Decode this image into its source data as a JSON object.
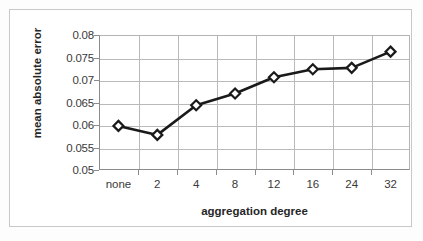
{
  "chart_data": {
    "type": "line",
    "title": "",
    "xlabel": "aggregation degree",
    "ylabel": "mean absolute error",
    "categories": [
      "none",
      "2",
      "4",
      "8",
      "12",
      "16",
      "24",
      "32"
    ],
    "values": [
      0.0598,
      0.0578,
      0.0644,
      0.067,
      0.0706,
      0.0724,
      0.0727,
      0.0763
    ],
    "series": [
      {
        "name": "mean absolute error",
        "values": [
          0.0598,
          0.0578,
          0.0644,
          0.067,
          0.0706,
          0.0724,
          0.0727,
          0.0763
        ]
      }
    ],
    "ylim": [
      0.05,
      0.08
    ],
    "yticks": [
      "0.05",
      "0.055",
      "0.06",
      "0.065",
      "0.07",
      "0.075",
      "0.08"
    ],
    "ytick_values": [
      0.05,
      0.055,
      0.06,
      0.065,
      0.07,
      0.075,
      0.08
    ],
    "xticks": [
      "none",
      "2",
      "4",
      "8",
      "12",
      "16",
      "24",
      "32"
    ],
    "grid": "horizontal-and-vertical",
    "legend": "none",
    "line_color": "#1a1a1a",
    "marker": "diamond",
    "marker_fill": "#ffffff",
    "marker_edge": "#1a1a1a",
    "plot_background": "#ffffff",
    "grid_color": "#b9b9b9",
    "axis_color": "#8c8c8c",
    "frame_color": "#c8c8c8"
  }
}
